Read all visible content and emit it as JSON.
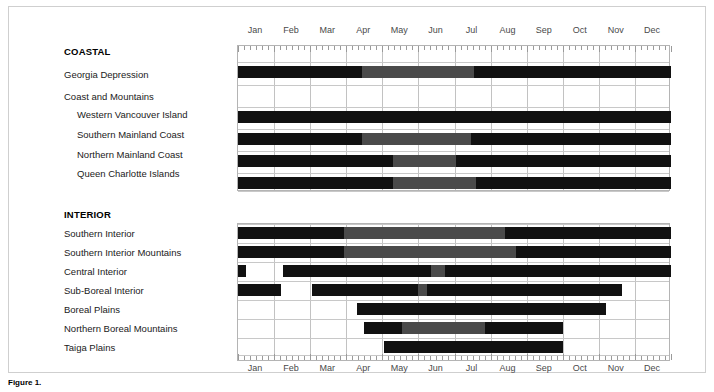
{
  "figure": {
    "months": [
      "Jan",
      "Feb",
      "Mar",
      "Apr",
      "May",
      "Jun",
      "Jul",
      "Aug",
      "Sep",
      "Oct",
      "Nov",
      "Dec"
    ],
    "groups": [
      {
        "name": "COASTAL"
      },
      {
        "name": "INTERIOR"
      }
    ],
    "coastal_labels": [
      "Georgia Depression",
      "Coast and Mountains",
      "Western Vancouver Island",
      "Southern Mainland Coast",
      "Northern Mainland Coast",
      "Queen Charlotte Islands"
    ],
    "interior_labels": [
      "Southern Interior",
      "Southern Interior Mountains",
      "Central Interior",
      "Sub-Boreal Interior",
      "Boreal Plains",
      "Northern Boreal Mountains",
      "Taiga Plains"
    ]
  },
  "colors": {
    "dark": "#111111",
    "mid": "#4a4a4a",
    "grid": "#c2c2c2",
    "frame": "#b4b4b4",
    "background": "#ffffff"
  },
  "caption": {
    "label": "Figure 1.",
    "text": ""
  },
  "chart_data": {
    "type": "bar",
    "title": "",
    "subtitle": "",
    "xlabel": "",
    "ylabel": "",
    "grid": true,
    "legend": "none",
    "xlim": [
      0,
      12
    ],
    "x_tick_labels": [
      "Jan",
      "Feb",
      "Mar",
      "Apr",
      "May",
      "Jun",
      "Jul",
      "Aug",
      "Sep",
      "Oct",
      "Nov",
      "Dec"
    ],
    "x_axis_note": "Months of the year; 0 = Jan 1, 12 = Dec 31. Values below are month-fractions.",
    "shade_legend": {
      "dark": "peak / primary period",
      "mid": "secondary / reduced period"
    },
    "panels": [
      {
        "name": "COASTAL",
        "rows": [
          {
            "label": "Georgia Depression",
            "segments": [
              {
                "start": 0.0,
                "end": 3.45,
                "shade": "dark"
              },
              {
                "start": 3.45,
                "end": 6.55,
                "shade": "mid"
              },
              {
                "start": 6.55,
                "end": 12.0,
                "shade": "dark"
              }
            ]
          },
          {
            "label": "Coast and Mountains",
            "segments": []
          },
          {
            "label": "Western Vancouver Island",
            "segments": [
              {
                "start": 0.0,
                "end": 12.0,
                "shade": "dark"
              }
            ]
          },
          {
            "label": "Southern Mainland Coast",
            "segments": [
              {
                "start": 0.0,
                "end": 3.45,
                "shade": "dark"
              },
              {
                "start": 3.45,
                "end": 6.45,
                "shade": "mid"
              },
              {
                "start": 6.45,
                "end": 12.0,
                "shade": "dark"
              }
            ]
          },
          {
            "label": "Northern Mainland Coast",
            "segments": [
              {
                "start": 0.0,
                "end": 4.3,
                "shade": "dark"
              },
              {
                "start": 4.3,
                "end": 6.05,
                "shade": "mid"
              },
              {
                "start": 6.05,
                "end": 12.0,
                "shade": "dark"
              }
            ]
          },
          {
            "label": "Queen Charlotte Islands",
            "segments": [
              {
                "start": 0.0,
                "end": 4.3,
                "shade": "dark"
              },
              {
                "start": 4.3,
                "end": 6.6,
                "shade": "mid"
              },
              {
                "start": 6.6,
                "end": 12.0,
                "shade": "dark"
              }
            ]
          }
        ]
      },
      {
        "name": "INTERIOR",
        "rows": [
          {
            "label": "Southern Interior",
            "segments": [
              {
                "start": 0.0,
                "end": 2.95,
                "shade": "dark"
              },
              {
                "start": 2.95,
                "end": 7.4,
                "shade": "mid"
              },
              {
                "start": 7.4,
                "end": 12.0,
                "shade": "dark"
              }
            ]
          },
          {
            "label": "Southern Interior Mountains",
            "segments": [
              {
                "start": 0.0,
                "end": 2.95,
                "shade": "dark"
              },
              {
                "start": 2.95,
                "end": 7.7,
                "shade": "mid"
              },
              {
                "start": 7.7,
                "end": 12.0,
                "shade": "dark"
              }
            ]
          },
          {
            "label": "Central Interior",
            "segments": [
              {
                "start": 0.0,
                "end": 0.22,
                "shade": "dark"
              },
              {
                "start": 1.25,
                "end": 5.35,
                "shade": "dark"
              },
              {
                "start": 5.35,
                "end": 5.75,
                "shade": "mid"
              },
              {
                "start": 5.75,
                "end": 12.0,
                "shade": "dark"
              }
            ]
          },
          {
            "label": "Sub-Boreal Interior",
            "segments": [
              {
                "start": 0.0,
                "end": 1.2,
                "shade": "dark"
              },
              {
                "start": 2.05,
                "end": 5.0,
                "shade": "dark"
              },
              {
                "start": 5.0,
                "end": 5.25,
                "shade": "mid"
              },
              {
                "start": 5.25,
                "end": 10.65,
                "shade": "dark"
              }
            ]
          },
          {
            "label": "Boreal Plains",
            "segments": [
              {
                "start": 3.3,
                "end": 10.2,
                "shade": "dark"
              }
            ]
          },
          {
            "label": "Northern Boreal Mountains",
            "segments": [
              {
                "start": 3.5,
                "end": 4.55,
                "shade": "dark"
              },
              {
                "start": 4.55,
                "end": 6.85,
                "shade": "mid"
              },
              {
                "start": 6.85,
                "end": 9.0,
                "shade": "dark"
              }
            ]
          },
          {
            "label": "Taiga Plains",
            "segments": [
              {
                "start": 4.05,
                "end": 9.0,
                "shade": "dark"
              }
            ]
          }
        ]
      }
    ]
  }
}
